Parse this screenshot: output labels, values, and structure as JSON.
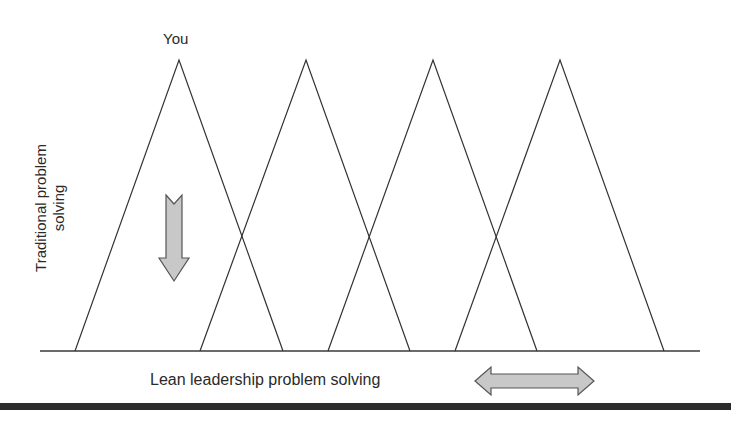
{
  "diagram": {
    "top_label": "You",
    "vertical_axis_label_line1": "Traditional problem",
    "vertical_axis_label_line2": "solving",
    "horizontal_axis_label": "Lean leadership problem solving",
    "triangles": [
      {
        "apex": [
          179,
          60
        ],
        "base_left": [
          75,
          351
        ],
        "base_right": [
          283,
          351
        ]
      },
      {
        "apex": [
          306,
          60
        ],
        "base_left": [
          200,
          351
        ],
        "base_right": [
          410,
          351
        ]
      },
      {
        "apex": [
          433,
          60
        ],
        "base_left": [
          328,
          351
        ],
        "base_right": [
          537,
          351
        ]
      },
      {
        "apex": [
          560,
          60
        ],
        "base_left": [
          455,
          351
        ],
        "base_right": [
          664,
          351
        ]
      }
    ],
    "arrows": {
      "vertical": "down-arrow",
      "horizontal": "left-right-arrow"
    },
    "colors": {
      "line": "#333333",
      "arrow_fill": "#c8c8c8",
      "arrow_stroke": "#555555",
      "bottom_bar": "#2b2b2b"
    }
  }
}
